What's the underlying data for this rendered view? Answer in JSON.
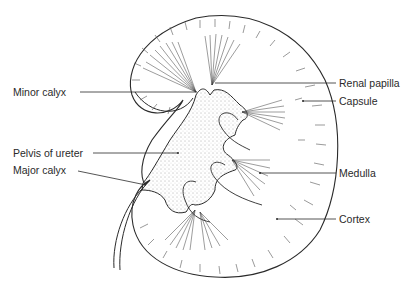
{
  "diagram": {
    "type": "anatomical-illustration",
    "labels_left": [
      {
        "id": "minor-calyx",
        "text": "Minor calyx"
      },
      {
        "id": "pelvis-of-ureter",
        "text": "Pelvis of ureter"
      },
      {
        "id": "major-calyx",
        "text": "Major calyx"
      }
    ],
    "labels_right": [
      {
        "id": "renal-papilla",
        "text": "Renal papilla"
      },
      {
        "id": "capsule",
        "text": "Capsule"
      },
      {
        "id": "medulla",
        "text": "Medulla"
      },
      {
        "id": "cortex",
        "text": "Cortex"
      }
    ],
    "colors": {
      "ink": "#2a2a2a",
      "background": "#ffffff"
    }
  }
}
